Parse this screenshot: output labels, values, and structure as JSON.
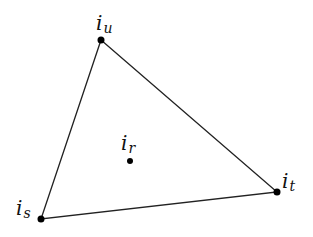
{
  "diagram": {
    "type": "triangle-with-interior-point",
    "stroke_color": "#222222",
    "point_color": "#000000",
    "vertices": [
      {
        "id": "u",
        "base": "i",
        "sub": "u",
        "x": 101,
        "y": 40
      },
      {
        "id": "s",
        "base": "i",
        "sub": "s",
        "x": 41,
        "y": 219
      },
      {
        "id": "t",
        "base": "i",
        "sub": "t",
        "x": 277,
        "y": 192
      }
    ],
    "interior_point": {
      "id": "r",
      "base": "i",
      "sub": "r",
      "x": 130,
      "y": 161
    },
    "edges": [
      [
        "u",
        "t"
      ],
      [
        "t",
        "s"
      ],
      [
        "s",
        "u"
      ]
    ],
    "labels": {
      "u": {
        "base": "i",
        "sub": "u"
      },
      "s": {
        "base": "i",
        "sub": "s"
      },
      "t": {
        "base": "i",
        "sub": "t"
      },
      "r": {
        "base": "i",
        "sub": "r"
      }
    }
  }
}
